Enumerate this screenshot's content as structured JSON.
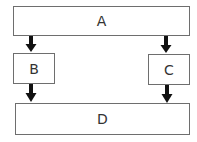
{
  "diagram": {
    "type": "flow",
    "nodes": [
      {
        "id": "A",
        "label": "A"
      },
      {
        "id": "B",
        "label": "B"
      },
      {
        "id": "C",
        "label": "C"
      },
      {
        "id": "D",
        "label": "D"
      }
    ],
    "edges": [
      {
        "from": "A",
        "to": "B"
      },
      {
        "from": "A",
        "to": "C"
      },
      {
        "from": "B",
        "to": "D"
      },
      {
        "from": "C",
        "to": "D"
      }
    ],
    "colors": {
      "border": "#6e6e6e",
      "arrow": "#111111",
      "text": "#333333",
      "background": "#ffffff"
    }
  }
}
